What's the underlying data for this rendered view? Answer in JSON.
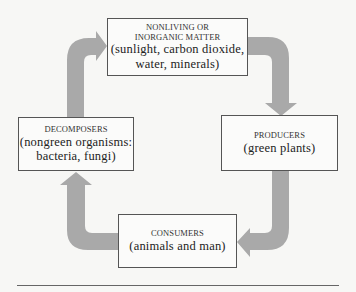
{
  "diagram": {
    "type": "cycle",
    "arrow_color": "#a9a9a9",
    "nodes": [
      {
        "id": "nonliving",
        "caption_line1": "NONLIVING OR",
        "caption_line2": "INORGANIC MATTER",
        "detail_line1": "(sunlight, carbon dioxide,",
        "detail_line2": "water, minerals)"
      },
      {
        "id": "producers",
        "caption": "PRODUCERS",
        "detail": "(green plants)"
      },
      {
        "id": "consumers",
        "caption": "CONSUMERS",
        "detail": "(animals and man)"
      },
      {
        "id": "decomposers",
        "caption": "DECOMPOSERS",
        "detail_line1": "(nongreen organisms:",
        "detail_line2": "bacteria, fungi)"
      }
    ],
    "edges": [
      {
        "from": "nonliving",
        "to": "producers"
      },
      {
        "from": "producers",
        "to": "consumers"
      },
      {
        "from": "consumers",
        "to": "decomposers"
      },
      {
        "from": "decomposers",
        "to": "nonliving"
      }
    ]
  }
}
